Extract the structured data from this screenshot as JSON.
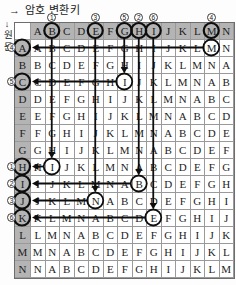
{
  "title": {
    "arrow": "→",
    "text": "암호 변환키"
  },
  "left_label": {
    "arrow": "↓",
    "text": "원문"
  },
  "table": {
    "column_headers": [
      "A",
      "B",
      "C",
      "D",
      "E",
      "F",
      "G",
      "H",
      "I",
      "J",
      "K",
      "L",
      "M",
      "N"
    ],
    "row_headers": [
      "A",
      "B",
      "C",
      "D",
      "E",
      "F",
      "G",
      "H",
      "I",
      "J",
      "K",
      "L",
      "M",
      "N"
    ],
    "rows": [
      "ABCDEFGHIJKLMN",
      "BCDEFGHIJKLMNA",
      "CDEFGHIJKLMNAB",
      "DEFGHIJKLMNABC",
      "EFGHIJKLMNABCD",
      "FGHIJKLMNABCDE",
      "GHIJKLMNABCDEF",
      "HIJKLMNABCDEFG",
      "IJKLMNABCDEFGH",
      "JKLMNABCDEFGHI",
      "KLMNABCDEFGHIJ",
      "LMNABCDEFGHIJK",
      "MNABCDEFGHIJKL",
      "NABCDEFGHIJKLM"
    ],
    "circled_column_headers": [
      "B",
      "E",
      "G",
      "H",
      "I",
      "M"
    ],
    "circled_row_headers": [
      "A",
      "C",
      "H",
      "I",
      "J",
      "K"
    ]
  },
  "mappings": [
    {
      "num": "1",
      "key_col": "B",
      "plain_row": "H",
      "cipher": "I"
    },
    {
      "num": "2",
      "key_col": "H",
      "plain_row": "I",
      "cipher": "B"
    },
    {
      "num": "3",
      "key_col": "E",
      "plain_row": "J",
      "cipher": "N"
    },
    {
      "num": "4",
      "key_col": "M",
      "plain_row": "A",
      "cipher": "M"
    },
    {
      "num": "5",
      "key_col": "G",
      "plain_row": "C",
      "cipher": "I"
    },
    {
      "num": "6",
      "key_col": "I",
      "plain_row": "K",
      "cipher": "E"
    }
  ],
  "colors": {
    "header_bg": "#b4b4b4",
    "grid_line": "#9a9a9a",
    "outer_border": "#6e6e6e",
    "mark_color": "#0d0d0d",
    "text_color": "#1c1c1c"
  }
}
